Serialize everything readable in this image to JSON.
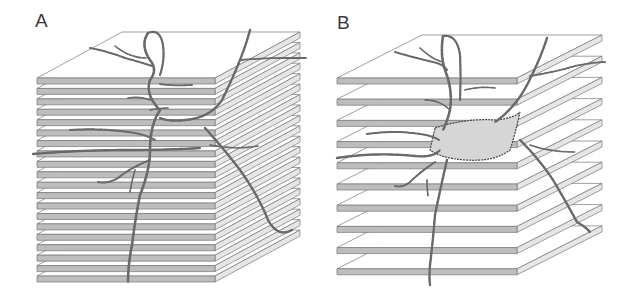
{
  "figure": {
    "panels": [
      {
        "label": "A",
        "description": "Neuron reconstruction embedded in a dense stack of serial sections",
        "slice_count": 20,
        "layout": "contiguous"
      },
      {
        "label": "B",
        "description": "Neuron reconstruction with serial sections pulled apart (exploded view)",
        "slice_count": 10,
        "layout": "separated"
      }
    ],
    "colors": {
      "slab_front": "#bdbdbd",
      "slab_edge": "#777777",
      "slab_top": "#ffffff",
      "neuron": "#6a6a6a",
      "neuron_dark": "#444444",
      "label": "#3a3a3a"
    }
  }
}
